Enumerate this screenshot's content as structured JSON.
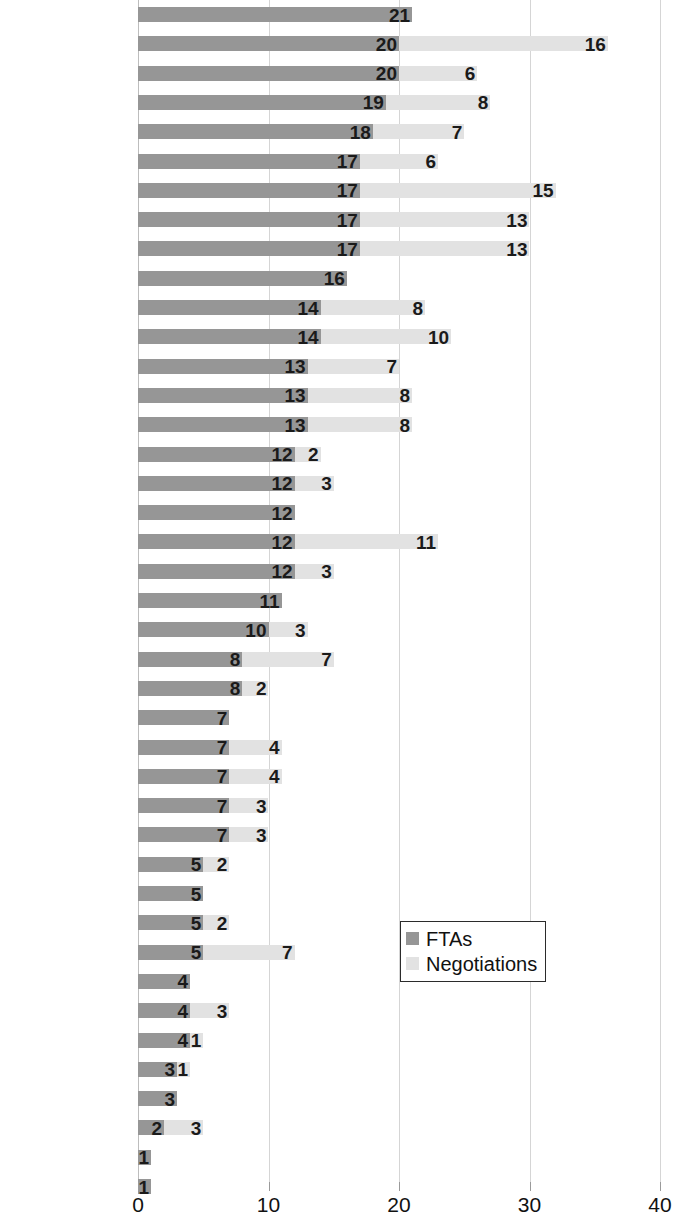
{
  "chart_data": {
    "type": "bar",
    "orientation": "horizontal",
    "stacked": true,
    "title": "",
    "subtitle": "",
    "xlabel": "",
    "ylabel": "",
    "xlim": [
      0,
      40
    ],
    "xticks": [
      0,
      10,
      20,
      30,
      40
    ],
    "xtick_labels": [
      "0",
      "10",
      "20",
      "30",
      "40"
    ],
    "grid": "vertical",
    "legend_position": "middle-right-inside",
    "colors": {
      "FTAs": "#969696",
      "Negotiations": "#e2e2e2",
      "gridline": "#d5d5d5",
      "text": "#111111",
      "legend_border": "#2b2b2b"
    },
    "legend": [
      "FTAs",
      "Negotiations"
    ],
    "series": [
      {
        "name": "FTAs",
        "values": [
          21,
          20,
          20,
          19,
          18,
          17,
          17,
          17,
          17,
          16,
          14,
          14,
          13,
          13,
          13,
          12,
          12,
          12,
          12,
          12,
          11,
          10,
          8,
          8,
          7,
          7,
          7,
          7,
          7,
          5,
          5,
          5,
          5,
          4,
          4,
          4,
          3,
          3,
          2,
          1,
          1
        ]
      },
      {
        "name": "Negotiations",
        "values": [
          0,
          16,
          6,
          8,
          7,
          6,
          15,
          13,
          13,
          0,
          8,
          10,
          7,
          8,
          8,
          2,
          3,
          0,
          11,
          3,
          0,
          3,
          7,
          2,
          0,
          4,
          4,
          3,
          3,
          2,
          0,
          2,
          7,
          0,
          3,
          1,
          1,
          0,
          3,
          0,
          0
        ]
      }
    ],
    "categories": [
      "Chile",
      "Singapore",
      "Switzerland",
      "Korea, Rep.",
      "Norway",
      "Malaysia",
      "India",
      "China",
      "EU",
      "Peru",
      "Vietnam",
      "Indonesia",
      "Philippines",
      "Thailand",
      "Japan",
      "Egypt",
      "Turkey",
      "Colombia",
      "Australia",
      "Mexico",
      "Myanmar",
      "Canada",
      "Pakistan",
      "United States",
      "Israel",
      "UAEmirates",
      "Saudi Arabia",
      "Argentina",
      "Brazil",
      "South Africa",
      "Nigeria",
      "Bangladesh",
      "Hong Kong",
      "Kenya",
      "Iran",
      "Ukraine",
      "Congo, DR",
      "Ethiopia",
      "Russia",
      "Tanzania",
      "Algeria"
    ]
  }
}
